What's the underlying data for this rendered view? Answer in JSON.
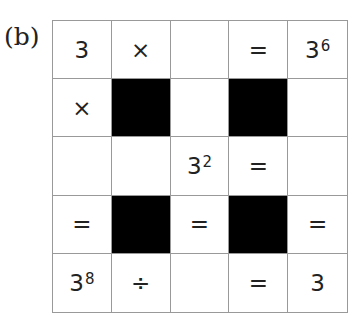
{
  "label": "(b)",
  "grid": [
    [
      {
        "t": "3"
      },
      {
        "t": "×"
      },
      {
        "t": ""
      },
      {
        "t": "="
      },
      {
        "t": "3",
        "sup": "6"
      }
    ],
    [
      {
        "t": "×"
      },
      {
        "black": true
      },
      {
        "t": ""
      },
      {
        "black": true
      },
      {
        "t": ""
      }
    ],
    [
      {
        "t": ""
      },
      {
        "t": ""
      },
      {
        "t": "3",
        "sup": "2"
      },
      {
        "t": "="
      },
      {
        "t": ""
      }
    ],
    [
      {
        "t": "="
      },
      {
        "black": true
      },
      {
        "t": "="
      },
      {
        "black": true
      },
      {
        "t": "="
      }
    ],
    [
      {
        "t": "3",
        "sup": "8"
      },
      {
        "t": "÷"
      },
      {
        "t": ""
      },
      {
        "t": "="
      },
      {
        "t": "3"
      }
    ]
  ]
}
